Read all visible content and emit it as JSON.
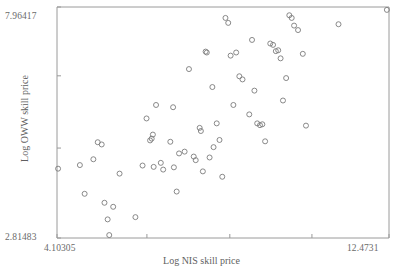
{
  "chart_data": {
    "type": "scatter",
    "title": "",
    "xlabel": "Log NIS skill price",
    "ylabel": "Log OWW skill price",
    "xlim": [
      4.10305,
      12.4731
    ],
    "ylim": [
      2.81483,
      7.96417
    ],
    "x_tick_labels": [
      "4.10305",
      "12.4731"
    ],
    "y_tick_labels": [
      "2.81483",
      "7.96417"
    ],
    "x_ticks": [
      4.10305,
      6.37,
      8.46,
      10.53,
      12.4731
    ],
    "y_ticks": [
      2.81483,
      4.82,
      6.43,
      7.96417
    ],
    "grid": false,
    "legend": null,
    "marker": {
      "shape": "open-circle",
      "size": 5,
      "stroke": "#7c7c7c",
      "fill": "none"
    },
    "axis_color": "#9a9a9a",
    "points": [
      {
        "x": 4.13,
        "y": 4.36
      },
      {
        "x": 4.68,
        "y": 4.44
      },
      {
        "x": 4.8,
        "y": 3.8
      },
      {
        "x": 5.02,
        "y": 4.57
      },
      {
        "x": 5.13,
        "y": 4.95
      },
      {
        "x": 5.23,
        "y": 4.9
      },
      {
        "x": 5.3,
        "y": 3.6
      },
      {
        "x": 5.38,
        "y": 3.23
      },
      {
        "x": 5.42,
        "y": 2.88
      },
      {
        "x": 5.52,
        "y": 3.51
      },
      {
        "x": 5.68,
        "y": 4.25
      },
      {
        "x": 6.08,
        "y": 3.28
      },
      {
        "x": 6.26,
        "y": 4.43
      },
      {
        "x": 6.36,
        "y": 5.48
      },
      {
        "x": 6.45,
        "y": 4.99
      },
      {
        "x": 6.49,
        "y": 5.03
      },
      {
        "x": 6.52,
        "y": 5.12
      },
      {
        "x": 6.54,
        "y": 4.4
      },
      {
        "x": 6.6,
        "y": 5.78
      },
      {
        "x": 6.72,
        "y": 4.49
      },
      {
        "x": 6.78,
        "y": 4.34
      },
      {
        "x": 6.96,
        "y": 4.96
      },
      {
        "x": 7.03,
        "y": 5.73
      },
      {
        "x": 7.05,
        "y": 4.39
      },
      {
        "x": 7.12,
        "y": 3.85
      },
      {
        "x": 7.18,
        "y": 4.7
      },
      {
        "x": 7.32,
        "y": 4.74
      },
      {
        "x": 7.43,
        "y": 6.58
      },
      {
        "x": 7.55,
        "y": 4.63
      },
      {
        "x": 7.6,
        "y": 4.55
      },
      {
        "x": 7.7,
        "y": 5.27
      },
      {
        "x": 7.73,
        "y": 5.2
      },
      {
        "x": 7.78,
        "y": 4.3
      },
      {
        "x": 7.85,
        "y": 6.97
      },
      {
        "x": 7.88,
        "y": 6.95
      },
      {
        "x": 7.95,
        "y": 4.61
      },
      {
        "x": 8.02,
        "y": 6.18
      },
      {
        "x": 8.05,
        "y": 4.84
      },
      {
        "x": 8.13,
        "y": 5.37
      },
      {
        "x": 8.2,
        "y": 5.0
      },
      {
        "x": 8.27,
        "y": 4.18
      },
      {
        "x": 8.35,
        "y": 7.72
      },
      {
        "x": 8.42,
        "y": 7.61
      },
      {
        "x": 8.48,
        "y": 6.88
      },
      {
        "x": 8.55,
        "y": 5.78
      },
      {
        "x": 8.62,
        "y": 6.95
      },
      {
        "x": 8.7,
        "y": 6.42
      },
      {
        "x": 8.78,
        "y": 6.35
      },
      {
        "x": 8.95,
        "y": 5.57
      },
      {
        "x": 9.02,
        "y": 7.23
      },
      {
        "x": 9.08,
        "y": 6.1
      },
      {
        "x": 9.15,
        "y": 5.37
      },
      {
        "x": 9.22,
        "y": 5.33
      },
      {
        "x": 9.28,
        "y": 5.35
      },
      {
        "x": 9.35,
        "y": 4.97
      },
      {
        "x": 9.48,
        "y": 7.15
      },
      {
        "x": 9.55,
        "y": 7.12
      },
      {
        "x": 9.62,
        "y": 6.98
      },
      {
        "x": 9.68,
        "y": 7.0
      },
      {
        "x": 9.74,
        "y": 6.82
      },
      {
        "x": 9.8,
        "y": 5.88
      },
      {
        "x": 9.88,
        "y": 6.38
      },
      {
        "x": 9.96,
        "y": 7.78
      },
      {
        "x": 10.02,
        "y": 7.72
      },
      {
        "x": 10.08,
        "y": 7.55
      },
      {
        "x": 10.18,
        "y": 7.45
      },
      {
        "x": 10.3,
        "y": 6.92
      },
      {
        "x": 10.38,
        "y": 5.32
      },
      {
        "x": 11.2,
        "y": 7.58
      },
      {
        "x": 12.42,
        "y": 7.9
      }
    ]
  }
}
